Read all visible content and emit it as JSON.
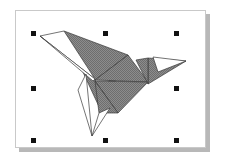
{
  "app": {
    "window_title": "Selected Bird Shape",
    "canvas_label": "drawing-canvas",
    "background_color": "#ffffff"
  },
  "document_frame": {
    "label": "document-page",
    "x": 15,
    "y": 10,
    "width": 191,
    "height": 138,
    "fill": "#ffffff",
    "border_color": "#c9c9c9",
    "shadow_color": "#b8b8b8",
    "shadow_offset": 4
  },
  "artwork": {
    "name": "origami-bird",
    "style": "low-poly triangles",
    "fill_gray": "#808080",
    "outline_color": "#3a3a3a",
    "outline_width": 0.7,
    "white_fill": "#ffffff",
    "shapes": [
      {
        "name": "wing-upper-large",
        "kind": "filled-triangle",
        "fill": "#808080",
        "points": "64,31 128,55 101,111"
      },
      {
        "name": "wing-leading-sliver-upper",
        "kind": "outline-triangle",
        "fill": "#ffffff",
        "points": "40,36 64,31 95,79"
      },
      {
        "name": "wing-leading-sliver-lower",
        "kind": "outline-triangle",
        "fill": "#ffffff",
        "points": "40,36 95,79 93,81"
      },
      {
        "name": "body-center-white",
        "kind": "outline-triangle",
        "fill": "#ffffff",
        "points": "128,55 101,92 95,80"
      },
      {
        "name": "breast-upper-gray",
        "kind": "filled-triangle",
        "fill": "#808080",
        "points": "95,80 128,55 148,82"
      },
      {
        "name": "body-lower-gray",
        "kind": "filled-triangle",
        "fill": "#808080",
        "points": "95,81 148,82 118,113"
      },
      {
        "name": "tail-gray",
        "kind": "filled-triangle",
        "fill": "#808080",
        "points": "95,81 118,113 99,113"
      },
      {
        "name": "leg-sliver-left",
        "kind": "outline-triangle",
        "fill": "#ffffff",
        "points": "86,74 92,136 78,90"
      },
      {
        "name": "leg-sliver-right",
        "kind": "outline-triangle",
        "fill": "#ffffff",
        "points": "92,136 110,108 99,113"
      },
      {
        "name": "head-gray",
        "kind": "filled-triangle",
        "fill": "#808080",
        "points": "148,58 186,61 148,84"
      },
      {
        "name": "beak-white",
        "kind": "outline-triangle",
        "fill": "#ffffff",
        "points": "153,57 186,61 158,72"
      },
      {
        "name": "neck-gray",
        "kind": "filled-triangle",
        "fill": "#808080",
        "points": "136,60 148,58 148,84"
      }
    ]
  },
  "selection": {
    "label": "selection-handles",
    "handle_color": "#111111",
    "handle_size": 5,
    "count": 8,
    "handles": [
      {
        "name": "handle-top-left",
        "x": 33,
        "y": 33
      },
      {
        "name": "handle-top-center",
        "x": 105,
        "y": 33
      },
      {
        "name": "handle-top-right",
        "x": 176,
        "y": 33
      },
      {
        "name": "handle-middle-left",
        "x": 33,
        "y": 88
      },
      {
        "name": "handle-middle-right",
        "x": 176,
        "y": 88
      },
      {
        "name": "handle-bottom-left",
        "x": 33,
        "y": 140
      },
      {
        "name": "handle-bottom-center",
        "x": 105,
        "y": 140
      },
      {
        "name": "handle-bottom-right",
        "x": 176,
        "y": 140
      }
    ]
  }
}
